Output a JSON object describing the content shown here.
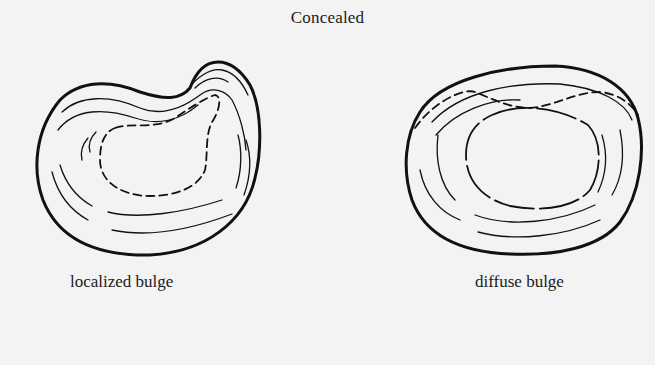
{
  "diagram": {
    "title": "Concealed",
    "panels": [
      {
        "id": "localized",
        "label": "localized bulge",
        "description": "Disc outline with a focal bulge at the upper right; inner nucleus shown with dashed line extending toward the bulge"
      },
      {
        "id": "diffuse",
        "label": "diffuse bulge",
        "description": "Rounded disc outline with a broad bulge along the upper border; dashed line marks original margin; inner oval nucleus"
      }
    ],
    "colors": {
      "background": "#f3f3f3",
      "ink": "#111111"
    }
  }
}
